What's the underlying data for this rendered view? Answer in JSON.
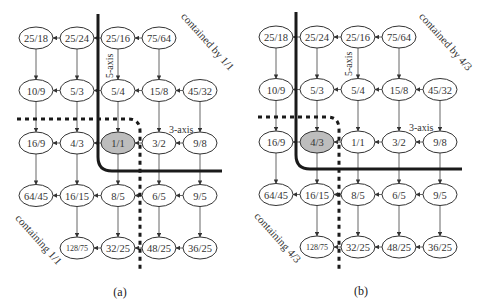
{
  "panels": [
    {
      "id": "a",
      "caption": "(a)",
      "highlight": "1/1",
      "contained_label": "contained by 1/1",
      "containing_label": "containing 1/1",
      "axis_5_label": "5-axis",
      "axis_3_label": "3-axis",
      "grid": [
        [
          "25/18",
          "25/24",
          "25/16",
          "75/64",
          ""
        ],
        [
          "10/9",
          "5/3",
          "5/4",
          "15/8",
          "45/32"
        ],
        [
          "16/9",
          "4/3",
          "1/1",
          "3/2",
          "9/8"
        ],
        [
          "64/45",
          "16/15",
          "8/5",
          "6/5",
          "9/5"
        ],
        [
          "",
          "128/75",
          "32/25",
          "48/25",
          "36/25"
        ]
      ]
    },
    {
      "id": "b",
      "caption": "(b)",
      "highlight": "4/3",
      "contained_label": "contained by 4/3",
      "containing_label": "containing 4/3",
      "axis_5_label": "5-axis",
      "axis_3_label": "3-axis",
      "grid": [
        [
          "25/18",
          "25/24",
          "25/16",
          "75/64",
          ""
        ],
        [
          "10/9",
          "5/3",
          "5/4",
          "15/8",
          "45/32"
        ],
        [
          "16/9",
          "4/3",
          "1/1",
          "3/2",
          "9/8"
        ],
        [
          "64/45",
          "16/15",
          "8/5",
          "6/5",
          "9/5"
        ],
        [
          "",
          "128/75",
          "32/25",
          "48/25",
          "36/25"
        ]
      ]
    }
  ],
  "colors": {
    "highlight_fill": "#bdbdbd",
    "node_stroke": "#333333",
    "boundary": "#1a1a1a"
  }
}
